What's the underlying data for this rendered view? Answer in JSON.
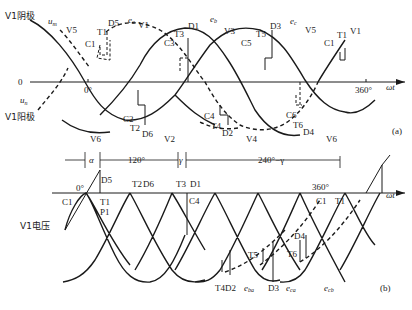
{
  "panel_a": {
    "tag": "(a)",
    "cathode_label": "V1阴极",
    "anode_label": "V1阳极",
    "um": "u",
    "um_sub": "m",
    "un": "u",
    "un_sub": "n",
    "origin": "0",
    "zero_deg": "0°",
    "deg360": "360°",
    "axis": "ωt",
    "top_labels": {
      "V5": "V5",
      "C1": "C1",
      "T1": "T1",
      "D5": "D5",
      "ea": "e",
      "ea_sub": "a",
      "V1": "V1",
      "C3": "C3",
      "T3": "T3",
      "D1": "D1",
      "eb": "e",
      "eb_sub": "b",
      "V3": "V3",
      "C5": "C5",
      "T5": "T5",
      "D3": "D3",
      "ec": "e",
      "ec_sub": "c",
      "V5b": "V5",
      "C1b": "C1",
      "T1b": "T1",
      "V1b": "V1"
    },
    "bottom_labels": {
      "V6": "V6",
      "C2": "C2",
      "T2": "T2",
      "D6": "D6",
      "V2": "V2",
      "C4": "C4",
      "T4": "T4",
      "D2": "D2",
      "V4": "V4",
      "C6": "C6",
      "T6": "T6",
      "D4": "D4",
      "V6b": "V6"
    }
  },
  "panel_b": {
    "tag": "(b)",
    "voltage_label": "V1电压",
    "alpha": "α",
    "deg120": "120°",
    "gamma": "γ",
    "deg240": "240°−γ",
    "zero_deg": "0°",
    "deg360": "360°",
    "axis": "ωt",
    "labels": {
      "D5": "D5",
      "C1": "C1",
      "T1": "T1",
      "P1": "P1",
      "T2": "T2",
      "D6": "D6",
      "T3": "T3",
      "D1": "D1",
      "C4": "C4",
      "T5": "T5",
      "T6": "T6",
      "D4": "D4",
      "C1b": "C1",
      "T1b": "T1",
      "T4D2": "T4D2",
      "D3": "D3",
      "eba": "e",
      "eba_sub": "ba",
      "eca": "e",
      "eca_sub": "ca",
      "ecb": "e",
      "ecb_sub": "cb"
    }
  },
  "colors": {
    "line": "#1a1a1a",
    "text": "#222222"
  }
}
